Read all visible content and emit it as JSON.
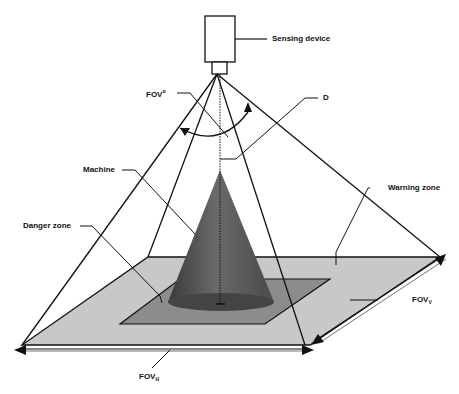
{
  "figure": {
    "labels": {
      "sensing_device": "Sensing device",
      "fov_alpha": "FOV",
      "fov_alpha_sup": "α",
      "d": "D",
      "machine": "Machine",
      "danger_zone": "Danger zone",
      "warning_zone": "Warning zone",
      "fov_v": "FOV",
      "fov_v_sub": "V",
      "fov_h": "FOV",
      "fov_h_sub": "H"
    },
    "colors": {
      "warning_zone_fill": "#c8c8c8",
      "danger_zone_fill": "#8c8c8c",
      "machine_cone": "#555555",
      "line": "#111111"
    }
  }
}
